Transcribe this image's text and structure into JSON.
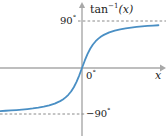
{
  "figure": {
    "title": "",
    "background_color": "#ffffff"
  },
  "labels": {
    "function_fn": "tan",
    "function_exponent": "−1",
    "function_arg": "(x)",
    "y_tick_positive": "90",
    "y_tick_negative": "−90",
    "origin": "0",
    "degree_symbol": "°",
    "x_axis": "x"
  },
  "colors": {
    "curve": "#4a8fc4",
    "axis": "#a8a8a8",
    "asymptote": "#888888",
    "text": "#1a1a1a",
    "background": "#ffffff"
  },
  "chart_data": {
    "type": "line",
    "xlabel": "x",
    "ylabel": "tan⁻¹(x)",
    "xlim": [
      -8.2,
      7.0
    ],
    "ylim": [
      -105,
      105
    ],
    "grid": false,
    "legend": null,
    "y_ticks": [
      {
        "value": 90,
        "label": "90°"
      },
      {
        "value": 0,
        "label": "0°"
      },
      {
        "value": -90,
        "label": "−90°"
      }
    ],
    "x_ticks": [],
    "asymptotes": [
      {
        "orientation": "horizontal",
        "value": 90,
        "style": "dashed",
        "label": "90°"
      },
      {
        "orientation": "horizontal",
        "value": -90,
        "style": "dashed",
        "label": "−90°"
      }
    ],
    "series": [
      {
        "name": "tan⁻¹(x)",
        "color": "#4a8fc4",
        "x": [
          -8.2,
          -7.5,
          -7.0,
          -6.5,
          -6.0,
          -5.5,
          -5.0,
          -4.5,
          -4.0,
          -3.5,
          -3.0,
          -2.5,
          -2.0,
          -1.75,
          -1.5,
          -1.25,
          -1.0,
          -0.75,
          -0.5,
          -0.25,
          0.0,
          0.25,
          0.5,
          0.75,
          1.0,
          1.25,
          1.5,
          1.75,
          2.0,
          2.5,
          3.0,
          3.5,
          4.0,
          4.5,
          5.0,
          5.5,
          6.0,
          6.5,
          7.0
        ],
        "y": [
          -83.0,
          -82.4,
          -81.9,
          -81.2,
          -80.5,
          -79.7,
          -78.7,
          -77.5,
          -76.0,
          -74.1,
          -71.6,
          -68.2,
          -63.4,
          -60.3,
          -56.3,
          -51.3,
          -45.0,
          -36.9,
          -26.6,
          -14.0,
          0.0,
          14.0,
          26.6,
          36.9,
          45.0,
          51.3,
          56.3,
          60.3,
          63.4,
          68.2,
          71.6,
          74.1,
          76.0,
          77.5,
          78.7,
          79.7,
          80.5,
          81.2,
          81.9
        ]
      }
    ]
  },
  "geometry": {
    "x_axis_y_px": 68,
    "y_axis_x_px": 82,
    "asymptote_pos_y_px": 21,
    "asymptote_neg_y_px": 114
  }
}
